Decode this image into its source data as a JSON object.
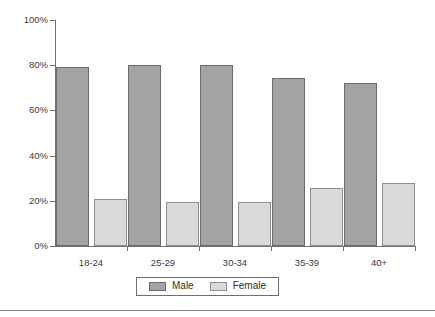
{
  "chart_data": {
    "type": "bar",
    "title": "",
    "subtitle": "",
    "xlabel": "",
    "ylabel": "",
    "categories": [
      "18-24",
      "25-29",
      "30-34",
      "35-39",
      "40+"
    ],
    "series": [
      {
        "name": "Male",
        "color": "#a3a3a3",
        "values": [
          79,
          80,
          80,
          74.5,
          72
        ]
      },
      {
        "name": "Female",
        "color": "#d9d9d9",
        "values": [
          21,
          19.5,
          19.5,
          25.5,
          28
        ]
      }
    ],
    "ylim": [
      0,
      100
    ],
    "yticks": [
      0,
      20,
      40,
      60,
      80,
      100
    ],
    "ytick_labels": [
      "0%",
      "20%",
      "40%",
      "60%",
      "80%",
      "100%"
    ],
    "xtick_labels": [
      "18-24",
      "25-29",
      "30-34",
      "35-39",
      "40+"
    ],
    "grid": false,
    "legend_position": "bottom-center",
    "legend_entries": [
      "Male",
      "Female"
    ],
    "value_format": "percent",
    "orientation": "vertical",
    "grouped": true
  },
  "axes": {
    "y_labels": [
      "100%",
      "80%",
      "60%",
      "40%",
      "20%",
      "0%"
    ],
    "y_values": [
      100,
      80,
      60,
      40,
      20,
      0
    ]
  },
  "legend": {
    "items": [
      {
        "label": "Male"
      },
      {
        "label": "Female"
      }
    ]
  },
  "colors": {
    "male_fill": "#a3a3a3",
    "male_stroke": "#6b6b6b",
    "female_fill": "#d9d9d9",
    "female_stroke": "#8f8f8f",
    "axis": "#6e6e6e",
    "text": "#3b3b3b"
  }
}
